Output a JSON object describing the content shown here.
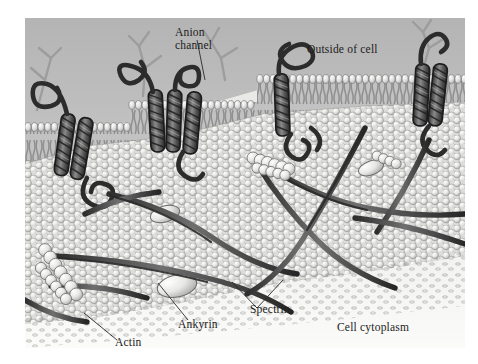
{
  "figure": {
    "type": "biological-diagram",
    "background_color": "#ffffff",
    "plate": {
      "x": 25,
      "y": 18,
      "width": 440,
      "height": 330,
      "extracellular_fill": "#c8c8c8",
      "cytoplasm_fill": "#f2f2f0"
    }
  },
  "labels": [
    {
      "id": "anion-channel",
      "text_line1": "Anion",
      "text_line2": "channel",
      "x": 175,
      "y": 26,
      "leader_to": {
        "x": 205,
        "y": 72
      }
    },
    {
      "id": "outside-of-cell",
      "text": "Outside of cell",
      "x": 307,
      "y": 43,
      "leader": false
    },
    {
      "id": "spectrin",
      "text": "Spectrin",
      "x": 250,
      "y": 303,
      "leader_to": [
        {
          "x": 232,
          "y": 282
        },
        {
          "x": 283,
          "y": 272
        }
      ]
    },
    {
      "id": "ankyrin",
      "text": "Ankyrin",
      "x": 178,
      "y": 318,
      "leader_to": {
        "x": 158,
        "y": 283
      }
    },
    {
      "id": "actin",
      "text": "Actin",
      "x": 115,
      "y": 336,
      "leader_to": {
        "x": 84,
        "y": 313
      }
    },
    {
      "id": "cell-cytoplasm",
      "text": "Cell cytoplasm",
      "x": 337,
      "y": 321,
      "leader": false
    }
  ],
  "structures": [
    {
      "name": "lipid-bilayer",
      "description": "phospholipid heads and tails forming the plasma membrane",
      "color": "#d9d9d9"
    },
    {
      "name": "anion-channel-protein",
      "description": "multipass helical transmembrane protein (band 3)",
      "color": "#4a4a4a"
    },
    {
      "name": "glycoprotein-carbohydrate-chain",
      "description": "branched oligosaccharide on the extracellular face",
      "color": "#a0a0a0"
    },
    {
      "name": "spectrin-filament",
      "description": "long flexible rope-like cytoskeletal filament",
      "color": "#3c3c3c"
    },
    {
      "name": "actin-filament",
      "description": "short chain of globular actin subunits forming junctional node",
      "color": "#e6e6e6"
    },
    {
      "name": "ankyrin-protein",
      "description": "ellipsoidal adaptor linking spectrin to the anion channel",
      "color": "#e8e8e6"
    },
    {
      "name": "membrane-inner-face-mesh",
      "description": "cytoplasmic face of the bilayer seen as overlapping scales",
      "color": "#dedede"
    }
  ],
  "palette": {
    "ink": "#1c1c1c",
    "protein_dark": "#3a3a3a",
    "protein_mid": "#6e6e6e",
    "lipid_head": "#dcdcdc",
    "lipid_tail": "#9a9a9a",
    "mesh_light": "#e4e4e2",
    "extracellular_top": "#bcbcbc",
    "cytoplasm": "#f3f3f1"
  }
}
